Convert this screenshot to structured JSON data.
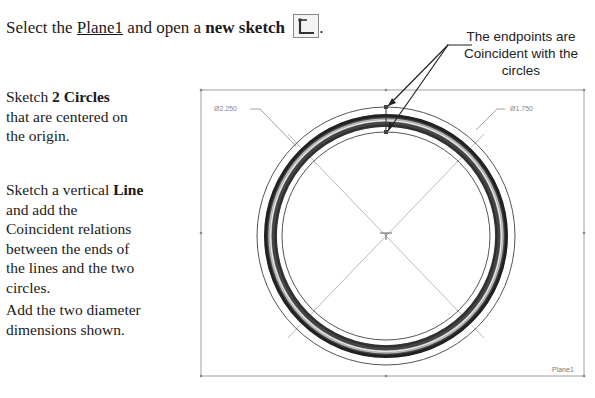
{
  "instruction": {
    "prefix": "Select the ",
    "plane_link": "Plane1",
    "middle": " and open a ",
    "bold": "new sketch",
    "icon": "sketch-icon",
    "suffix": "."
  },
  "steps": [
    {
      "pre": "Sketch ",
      "bold": "2 Circles",
      "post": " that are centered on the origin."
    },
    {
      "pre": "Sketch a vertical ",
      "bold": "Line",
      "post": " and add the Coincident relations between the ends of the lines and the two circles."
    },
    {
      "pre": "",
      "bold": "",
      "post": "Add the two diameter dimensions shown."
    }
  ],
  "callout": {
    "text": "The endpoints are Coincident with the circles"
  },
  "drawing": {
    "dim_outer": "Ø2.250",
    "dim_inner": "Ø1.750",
    "plane_label": "Plane1",
    "colors": {
      "frame": "#9a9a9a",
      "ring_dark": "#2a2a2a",
      "thin": "#555555"
    }
  }
}
